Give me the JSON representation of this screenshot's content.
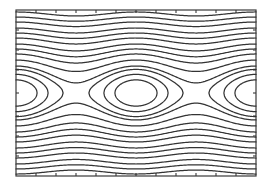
{
  "chart_data": {
    "type": "contour",
    "title": "",
    "xlabel": "",
    "ylabel": "",
    "function": "H(theta, p) = p^2/2 - cos(theta)",
    "x_range_theta": [
      -6.2832,
      6.2832
    ],
    "o_points_x_px": [
      16,
      136,
      256
    ],
    "x_points_x_px": [
      76,
      196
    ],
    "closed_levels": [
      -0.45,
      0.11,
      0.78
    ],
    "open_levels": [
      1.33,
      2.48,
      3.87,
      5.2,
      6.68,
      8.68,
      10.52,
      12.52,
      15.13,
      17.48,
      20.0
    ],
    "grid": false,
    "legend": null,
    "tick_labels": [],
    "frame_px": {
      "left": 16,
      "top": 10,
      "right": 256,
      "bottom": 176
    },
    "center_y_px": 93,
    "px_per_theta_period": 120,
    "px_per_p_unit": 12.5,
    "top_ticks_x_px": [
      36,
      56,
      76,
      96,
      116,
      136,
      156,
      176,
      196,
      216,
      236
    ],
    "bottom_ticks_x_px": [
      36,
      56,
      76,
      96,
      116,
      136,
      156,
      176,
      196,
      216,
      236
    ],
    "left_ticks_y_px": [
      30,
      50,
      70,
      93,
      116,
      136,
      156
    ],
    "right_ticks_y_px": [
      30,
      50,
      70,
      93,
      116,
      136,
      156
    ],
    "line_color": "#333333"
  }
}
